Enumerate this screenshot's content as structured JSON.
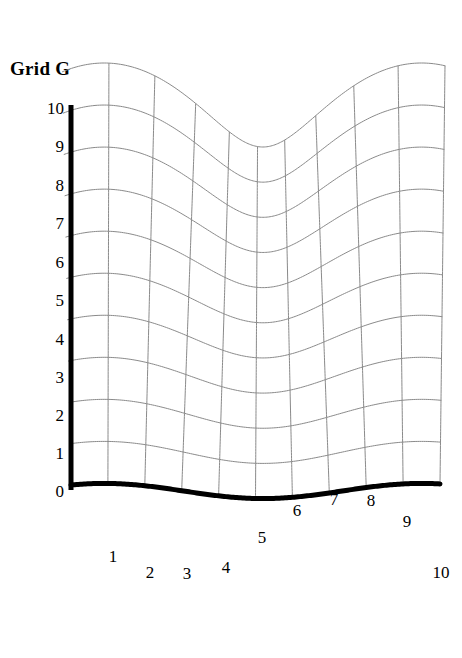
{
  "figure": {
    "title": "Grid G",
    "background_color": "#ffffff",
    "axis_color": "#000000",
    "grid_color": "#8a8a8a",
    "boundary_color": "#000000"
  },
  "y_axis": {
    "label_color": "#000000",
    "ticks": [
      {
        "label": "10",
        "value": 10,
        "x": 64,
        "y": 108
      },
      {
        "label": "9",
        "value": 9,
        "x": 64,
        "y": 146
      },
      {
        "label": "8",
        "value": 8,
        "x": 64,
        "y": 185
      },
      {
        "label": "7",
        "value": 7,
        "x": 64,
        "y": 223
      },
      {
        "label": "6",
        "value": 6,
        "x": 64,
        "y": 262
      },
      {
        "label": "5",
        "value": 5,
        "x": 64,
        "y": 300
      },
      {
        "label": "4",
        "value": 4,
        "x": 64,
        "y": 339
      },
      {
        "label": "3",
        "value": 3,
        "x": 64,
        "y": 377
      },
      {
        "label": "2",
        "value": 2,
        "x": 64,
        "y": 415
      },
      {
        "label": "1",
        "value": 1,
        "x": 64,
        "y": 453
      },
      {
        "label": "0",
        "value": 0,
        "x": 64,
        "y": 491
      }
    ]
  },
  "x_axis": {
    "label_color": "#000000",
    "ticks": [
      {
        "label": "1",
        "value": 1,
        "x": 113,
        "y": 556
      },
      {
        "label": "2",
        "value": 2,
        "x": 150,
        "y": 572
      },
      {
        "label": "3",
        "value": 3,
        "x": 187,
        "y": 573
      },
      {
        "label": "4",
        "value": 4,
        "x": 226,
        "y": 567
      },
      {
        "label": "5",
        "value": 5,
        "x": 262,
        "y": 537
      },
      {
        "label": "6",
        "value": 6,
        "x": 297,
        "y": 510
      },
      {
        "label": "7",
        "value": 7,
        "x": 334,
        "y": 499
      },
      {
        "label": "8",
        "value": 8,
        "x": 371,
        "y": 500
      },
      {
        "label": "9",
        "value": 9,
        "x": 407,
        "y": 521
      },
      {
        "label": "10",
        "value": 10,
        "x": 441,
        "y": 572
      }
    ]
  },
  "chart_data": {
    "type": "line",
    "title": "Grid G",
    "xlabel": "",
    "ylabel": "",
    "xlim": [
      0,
      10
    ],
    "ylim": [
      0,
      10
    ],
    "grid": true,
    "legend": "none",
    "grid_geometry": {
      "columns": 11,
      "rows": 11,
      "x_pixel_left": 71,
      "x_pixel_right": 440,
      "x_pixel_step": 36.9,
      "y_pixel_top": 105,
      "y_pixel_bottom": 491,
      "y_pixel_step": 38.6,
      "wave_amplitude_px": 42,
      "wave_period_units": 8.6,
      "wave_phase_units": 0.9,
      "shear_px": 14
    },
    "series": [
      {
        "name": "bottom-boundary (heavy)",
        "x": [
          0,
          1,
          2,
          3,
          4,
          5,
          6,
          7,
          8,
          9,
          10
        ],
        "y_pixel": [
          490,
          528,
          549,
          553,
          539,
          516,
          499,
          493,
          497,
          517,
          555
        ],
        "linewidth": 5,
        "color": "#000000"
      },
      {
        "name": "left-axis (heavy)",
        "x": [
          0,
          0
        ],
        "y_pixel": [
          105,
          490
        ],
        "linewidth": 5,
        "color": "#000000"
      }
    ]
  }
}
